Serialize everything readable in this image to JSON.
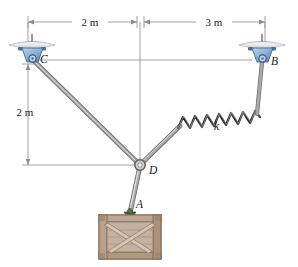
{
  "figure": {
    "type": "statics-free-body-diagram"
  },
  "dimensions": {
    "horizontal_left": "2 m",
    "horizontal_right": "3 m",
    "vertical_left": "2 m"
  },
  "labels": {
    "point_c": "C",
    "point_b": "B",
    "point_d": "D",
    "point_a": "A",
    "spring": "k"
  },
  "colors": {
    "cable": "#8a8a8a",
    "cable_light": "#d8d8d8",
    "spring": "#2e2e2e",
    "bracket_blue": "#8fb4d9",
    "bracket_blue_dark": "#4a6f9c",
    "ceiling_plate": "#e3e4e6",
    "ceiling_plate_dark": "#9ea2a6",
    "crate_wood": "#c3ab9a",
    "crate_wood_dark": "#8d7360",
    "crate_frame": "#a38a76",
    "dimension_line": "#8b8b8b",
    "text": "#1a1a1a"
  },
  "geometry": {
    "support_c": {
      "x": 32,
      "y": 58
    },
    "support_b": {
      "x": 262,
      "y": 58
    },
    "node_d": {
      "x": 140,
      "y": 165
    },
    "crate_top": {
      "x": 130,
      "y": 212
    },
    "center_x": 140,
    "dim_top_y": 22,
    "dim_left_x": 28,
    "dim_right_x": 265,
    "dim_bottom_y": 165
  }
}
